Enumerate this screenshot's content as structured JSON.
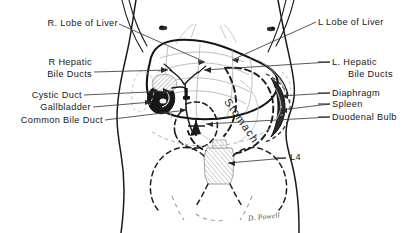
{
  "figure": {
    "signature": "D. Powell",
    "line_color": "#1a1a1a",
    "dashed_color": "#3a3a3a",
    "shade_color": "#9a9a9a",
    "background": "#ffffff"
  },
  "labels_left": [
    {
      "id": "r-lobe-of-liver",
      "text": "R. Lobe of Liver",
      "line2": ""
    },
    {
      "id": "r-hepatic-bile-ducts",
      "text": "R Hepatic",
      "line2": "Bile Ducts"
    },
    {
      "id": "cystic-duct",
      "text": "Cystic Duct",
      "line2": ""
    },
    {
      "id": "gallbladder",
      "text": "Gallbladder",
      "line2": ""
    },
    {
      "id": "common-bile-duct",
      "text": "Common Bile Duct",
      "line2": ""
    }
  ],
  "labels_right": [
    {
      "id": "l-lobe-of-liver",
      "text": "L Lobe of Liver",
      "line2": ""
    },
    {
      "id": "l-hepatic-bile-ducts",
      "text": "L. Hepatic",
      "line2": "Bile Ducts"
    },
    {
      "id": "diaphragm",
      "text": "Diaphragm",
      "line2": ""
    },
    {
      "id": "spleen",
      "text": "Spleen",
      "line2": ""
    },
    {
      "id": "duodenal-bulb",
      "text": "Duodenal Bulb",
      "line2": ""
    },
    {
      "id": "l4-vertebra",
      "text": "L4",
      "line2": ""
    }
  ],
  "inline_labels": [
    {
      "id": "stomach",
      "text": "Stomach"
    }
  ]
}
